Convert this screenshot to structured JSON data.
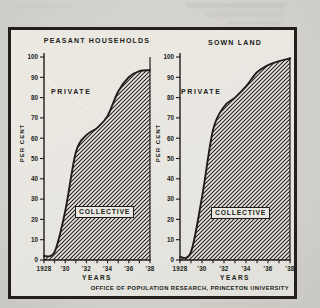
{
  "page": {
    "type": "scanned-book-figure",
    "footer_credit": "OFFICE OF POPULATION RESEARCH, PRINCETON UNIVERSITY"
  },
  "colors": {
    "ink": "#201d19",
    "paper": "#d3d1cb",
    "panel": "#eae8e2"
  },
  "chart_data": [
    {
      "type": "area",
      "title": "PEASANT HOUSEHOLDS",
      "xlabel": "YEARS",
      "ylabel": "PER CENT",
      "ylim": [
        0,
        100
      ],
      "grid": false,
      "legend_position": "inside",
      "x": [
        1928,
        1929,
        1930,
        1931,
        1932,
        1933,
        1934,
        1935,
        1936,
        1937,
        1938
      ],
      "x_tick_labels": [
        "1928",
        "'30",
        "'32",
        "'34",
        "'36",
        "'38"
      ],
      "y_ticks": [
        0,
        10,
        20,
        30,
        40,
        50,
        60,
        70,
        80,
        90,
        100
      ],
      "series": [
        {
          "name": "COLLECTIVE",
          "style": "hatched-area",
          "values": [
            2,
            4,
            24,
            53,
            61.5,
            65,
            71,
            83,
            90,
            93,
            93.5
          ]
        }
      ],
      "region_labels": {
        "upper": "PRIVATE",
        "lower": "COLLECTIVE"
      }
    },
    {
      "type": "area",
      "title": "SOWN LAND",
      "xlabel": "YEARS",
      "ylabel": "PER CENT",
      "ylim": [
        0,
        100
      ],
      "grid": false,
      "legend_position": "inside",
      "x": [
        1928,
        1929,
        1930,
        1931,
        1932,
        1933,
        1934,
        1935,
        1936,
        1937,
        1938
      ],
      "x_tick_labels": [
        "1928",
        "'30",
        "'32",
        "'34",
        "'36",
        "'38"
      ],
      "y_ticks": [
        0,
        10,
        20,
        30,
        40,
        50,
        60,
        70,
        80,
        90,
        100
      ],
      "series": [
        {
          "name": "COLLECTIVE",
          "style": "hatched-area",
          "values": [
            1.5,
            4,
            31,
            64,
            75.5,
            80,
            85.5,
            92.5,
            96,
            98,
            99.3
          ]
        }
      ],
      "region_labels": {
        "upper": "PRIVATE",
        "lower": "COLLECTIVE"
      }
    }
  ]
}
